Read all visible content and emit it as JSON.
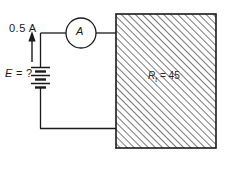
{
  "figure": {
    "current_label": "0.5 A",
    "source_label_symbol": "E",
    "source_label_value": " = ?",
    "meter_label": "A",
    "resistor_symbol": "R",
    "resistor_subscript": "t",
    "resistor_value": " = 45",
    "caption": "",
    "colors": {
      "wire": "#1a1a1a",
      "hatch": "#555555",
      "box_border": "#1a1a1a",
      "background": "#ffffff",
      "text": "#1a1a1a"
    }
  },
  "components": {
    "ammeter": "ammeter-circle",
    "battery": "multi-cell-battery",
    "load": "hatched-resistive-block",
    "current_arrow": "current-direction-arrow"
  }
}
